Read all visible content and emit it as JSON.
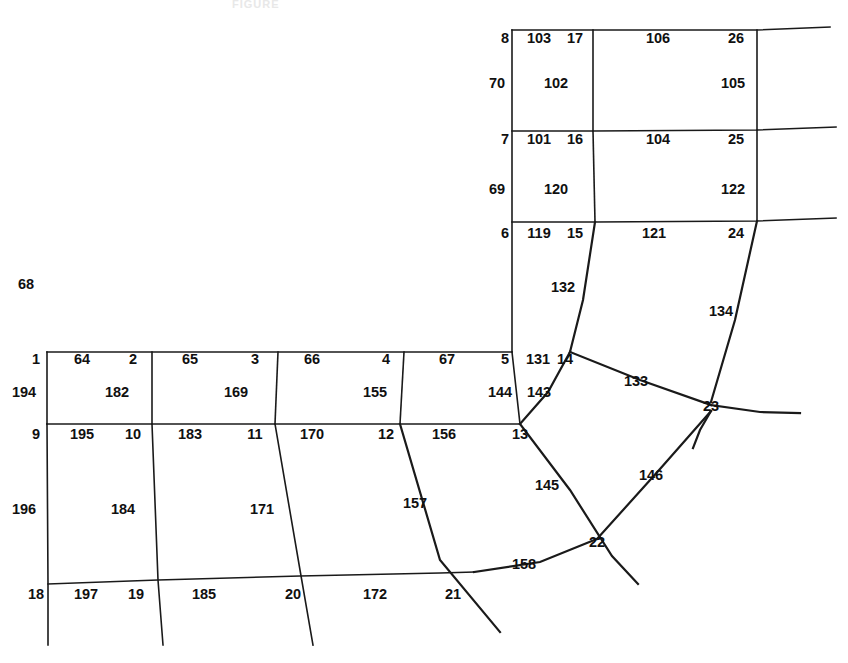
{
  "figure": {
    "title_faint": "FIGURE",
    "width": 848,
    "height": 663,
    "line_color": "#1a1a1a",
    "background_color": "#ffffff",
    "text_color": "#101010"
  },
  "chart_data": {
    "type": "diagram",
    "title": "",
    "xlabel": "",
    "ylabel": "",
    "grid": false,
    "legend": "none",
    "node_labels": [
      {
        "id": "1",
        "x": 36,
        "y": 364
      },
      {
        "id": "2",
        "x": 133,
        "y": 364
      },
      {
        "id": "3",
        "x": 255,
        "y": 364
      },
      {
        "id": "4",
        "x": 386,
        "y": 364
      },
      {
        "id": "5",
        "x": 505,
        "y": 364
      },
      {
        "id": "6",
        "x": 505,
        "y": 238
      },
      {
        "id": "7",
        "x": 505,
        "y": 144
      },
      {
        "id": "8",
        "x": 505,
        "y": 43
      },
      {
        "id": "9",
        "x": 36,
        "y": 439
      },
      {
        "id": "10",
        "x": 133,
        "y": 439
      },
      {
        "id": "11",
        "x": 255,
        "y": 439
      },
      {
        "id": "12",
        "x": 386,
        "y": 439
      },
      {
        "id": "13",
        "x": 520,
        "y": 439
      },
      {
        "id": "14",
        "x": 565,
        "y": 364
      },
      {
        "id": "15",
        "x": 575,
        "y": 238
      },
      {
        "id": "16",
        "x": 575,
        "y": 144
      },
      {
        "id": "17",
        "x": 575,
        "y": 43
      },
      {
        "id": "18",
        "x": 36,
        "y": 599
      },
      {
        "id": "19",
        "x": 136,
        "y": 599
      },
      {
        "id": "20",
        "x": 293,
        "y": 599
      },
      {
        "id": "21",
        "x": 453,
        "y": 599
      },
      {
        "id": "22",
        "x": 597,
        "y": 547
      },
      {
        "id": "23",
        "x": 711,
        "y": 411
      },
      {
        "id": "24",
        "x": 736,
        "y": 238
      },
      {
        "id": "25",
        "x": 736,
        "y": 144
      },
      {
        "id": "26",
        "x": 736,
        "y": 43
      }
    ],
    "edge_labels": [
      {
        "id": "64",
        "x": 82,
        "y": 364
      },
      {
        "id": "65",
        "x": 190,
        "y": 364
      },
      {
        "id": "66",
        "x": 312,
        "y": 364
      },
      {
        "id": "67",
        "x": 447,
        "y": 364
      },
      {
        "id": "68",
        "x": 26,
        "y": 289
      },
      {
        "id": "69",
        "x": 497,
        "y": 194
      },
      {
        "id": "70",
        "x": 497,
        "y": 88
      },
      {
        "id": "101",
        "x": 539,
        "y": 144
      },
      {
        "id": "102",
        "x": 556,
        "y": 88
      },
      {
        "id": "103",
        "x": 539,
        "y": 43
      },
      {
        "id": "104",
        "x": 658,
        "y": 144
      },
      {
        "id": "105",
        "x": 733,
        "y": 88
      },
      {
        "id": "106",
        "x": 658,
        "y": 43
      },
      {
        "id": "119",
        "x": 539,
        "y": 238
      },
      {
        "id": "120",
        "x": 556,
        "y": 194
      },
      {
        "id": "121",
        "x": 654,
        "y": 238
      },
      {
        "id": "122",
        "x": 733,
        "y": 194
      },
      {
        "id": "131",
        "x": 538,
        "y": 364
      },
      {
        "id": "132",
        "x": 563,
        "y": 292
      },
      {
        "id": "133",
        "x": 636,
        "y": 386
      },
      {
        "id": "134",
        "x": 721,
        "y": 316
      },
      {
        "id": "143",
        "x": 539,
        "y": 397
      },
      {
        "id": "144",
        "x": 500,
        "y": 397
      },
      {
        "id": "145",
        "x": 547,
        "y": 490
      },
      {
        "id": "146",
        "x": 651,
        "y": 480
      },
      {
        "id": "155",
        "x": 375,
        "y": 397
      },
      {
        "id": "156",
        "x": 444,
        "y": 439
      },
      {
        "id": "157",
        "x": 415,
        "y": 508
      },
      {
        "id": "158",
        "x": 524,
        "y": 569
      },
      {
        "id": "169",
        "x": 236,
        "y": 397
      },
      {
        "id": "170",
        "x": 312,
        "y": 439
      },
      {
        "id": "171",
        "x": 262,
        "y": 514
      },
      {
        "id": "172",
        "x": 375,
        "y": 599
      },
      {
        "id": "182",
        "x": 117,
        "y": 397
      },
      {
        "id": "183",
        "x": 190,
        "y": 439
      },
      {
        "id": "184",
        "x": 123,
        "y": 514
      },
      {
        "id": "185",
        "x": 204,
        "y": 599
      },
      {
        "id": "194",
        "x": 24,
        "y": 397
      },
      {
        "id": "195",
        "x": 82,
        "y": 439
      },
      {
        "id": "196",
        "x": 24,
        "y": 514
      },
      {
        "id": "197",
        "x": 86,
        "y": 599
      }
    ],
    "polylines": [
      {
        "name": "top-horizontal-row8",
        "points": "512,30 593,30 757,30 830,27"
      },
      {
        "name": "horizontal-row7",
        "points": "512,131 593,131 757,130 836,127"
      },
      {
        "name": "horizontal-row6",
        "points": "512,222 595,222 757,221 836,218"
      },
      {
        "name": "vertical-left-upper",
        "points": "512,30 512,352"
      },
      {
        "name": "vertical-col17",
        "points": "593,30 593,131"
      },
      {
        "name": "vertical-col16",
        "points": "593,131 595,222"
      },
      {
        "name": "vertical-col26",
        "points": "757,30 757,130"
      },
      {
        "name": "vertical-col25",
        "points": "757,130 757,221"
      },
      {
        "name": "edge-132-15-to-14",
        "points": "595,222 583,300 570,352"
      },
      {
        "name": "edge-134-24-to-23",
        "points": "757,221 735,320 711,402"
      },
      {
        "name": "grid-top-row1",
        "points": "47,352 152,352 278,352 404,352 512,352"
      },
      {
        "name": "grid-mid-row9",
        "points": "47,424 152,424 275,424 400,424 520,424"
      },
      {
        "name": "vertical-1-9",
        "points": "47,352 47,424"
      },
      {
        "name": "vertical-2-10",
        "points": "152,352 152,424"
      },
      {
        "name": "vertical-3-11",
        "points": "278,352 275,424"
      },
      {
        "name": "vertical-4-12",
        "points": "404,352 400,424"
      },
      {
        "name": "vertical-5-13",
        "points": "512,352 520,424"
      },
      {
        "name": "edge-196-9-18",
        "points": "47,424 48,584 48,645"
      },
      {
        "name": "edge-184-10-19",
        "points": "152,424 158,580 163,645"
      },
      {
        "name": "edge-171-11-20",
        "points": "275,424 300,570 313,645"
      },
      {
        "name": "edge-157-12-21",
        "points": "400,424 440,560 500,632"
      },
      {
        "name": "grid-bottom-row18",
        "points": "48,584 158,580 300,576 440,573 474,572"
      },
      {
        "name": "edge-158-21-22",
        "points": "474,572 540,562 597,539"
      },
      {
        "name": "edge-145-13-22",
        "points": "520,424 570,490 612,556 638,584"
      },
      {
        "name": "edge-146-22-23",
        "points": "597,539 660,469 711,411"
      },
      {
        "name": "edge-143-13-14",
        "points": "520,424 548,392 570,352"
      },
      {
        "name": "edge-133-14-23",
        "points": "570,352 640,380 711,405"
      },
      {
        "name": "edge-23-right-tail",
        "points": "711,405 760,412 800,413"
      },
      {
        "name": "edge-23-down-tail",
        "points": "711,411 700,430 693,448"
      }
    ],
    "line_widths": {
      "grid": 1.6,
      "thick": 2.2
    }
  }
}
